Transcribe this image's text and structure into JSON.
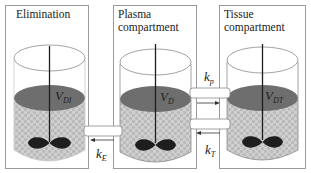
{
  "compartments": [
    {
      "id": "elimination",
      "title": "Elimination",
      "volume_main": "V",
      "volume_sub": "DI"
    },
    {
      "id": "plasma",
      "title_line1": "Plasma",
      "title_line2": "compartment",
      "volume_main": "V",
      "volume_sub": "D"
    },
    {
      "id": "tissue",
      "title_line1": "Tissue",
      "title_line2": "compartment",
      "volume_main": "V",
      "volume_sub": "DT"
    }
  ],
  "rates": {
    "kE": {
      "main": "k",
      "sub": "E"
    },
    "kp": {
      "main": "k",
      "sub": "p"
    },
    "kT": {
      "main": "k",
      "sub": "T"
    }
  },
  "colors": {
    "liquid_top": "#6e6e6e",
    "liquid_body": "#c8c8c8",
    "box_border": "#9a9a9a",
    "impeller": "#1e1e1e"
  }
}
